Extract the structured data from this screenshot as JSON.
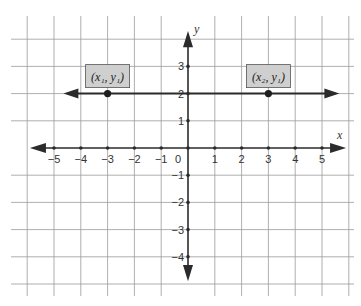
{
  "chart_data": {
    "type": "line",
    "title": "",
    "xlabel": "x",
    "ylabel": "y",
    "xlim": [
      -5,
      5
    ],
    "ylim": [
      -4,
      3
    ],
    "grid": true,
    "x_ticks": [
      -5,
      -4,
      -3,
      -2,
      -1,
      0,
      1,
      2,
      3,
      4,
      5
    ],
    "x_tick_labels": [
      "−5",
      "−4",
      "−3",
      "−2",
      "−1",
      "0",
      "1",
      "2",
      "3",
      "4",
      "5"
    ],
    "y_ticks": [
      3,
      2,
      1,
      -1,
      -2,
      -3,
      -4
    ],
    "y_tick_labels": [
      "3",
      "2",
      "1",
      "−1",
      "−2",
      "−3",
      "−4"
    ],
    "series": [
      {
        "name": "horizontal line y = y1",
        "kind": "line-with-arrows",
        "y": 2,
        "x_range": [
          -4.5,
          5.5
        ]
      }
    ],
    "points": [
      {
        "x": -3,
        "y": 2,
        "label": "(x₁, y₁)"
      },
      {
        "x": 3,
        "y": 2,
        "label": "(x₂, y₁)"
      }
    ]
  },
  "labels": {
    "x_axis": "x",
    "y_axis": "y",
    "point1": "(x₁, y₁)",
    "point2": "(x₂, y₁)",
    "origin": "0"
  }
}
